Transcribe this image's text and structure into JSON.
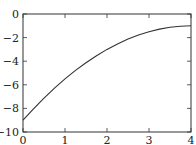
{
  "chart_data": {
    "type": "line",
    "title": "",
    "xlabel": "",
    "ylabel": "",
    "xlim": [
      0,
      4
    ],
    "ylim": [
      -10,
      0
    ],
    "xticks": [
      0,
      1,
      2,
      3,
      4
    ],
    "yticks": [
      0,
      -2,
      -4,
      -6,
      -8,
      -10
    ],
    "xtick_labels": [
      "0",
      "1",
      "2",
      "3",
      "4"
    ],
    "ytick_labels": [
      "0",
      "−2",
      "−4",
      "−6",
      "−8",
      "−10"
    ],
    "grid": false,
    "legend": null,
    "series": [
      {
        "name": "curve",
        "color": "#333333",
        "x": [
          0,
          0.25,
          0.5,
          0.75,
          1,
          1.25,
          1.5,
          1.75,
          2,
          2.25,
          2.5,
          2.75,
          3,
          3.25,
          3.5,
          3.75,
          4
        ],
        "y": [
          -9,
          -8.03,
          -7.13,
          -6.28,
          -5.5,
          -4.78,
          -4.13,
          -3.53,
          -3,
          -2.53,
          -2.13,
          -1.78,
          -1.5,
          -1.28,
          -1.13,
          -1.03,
          -1
        ]
      }
    ]
  }
}
